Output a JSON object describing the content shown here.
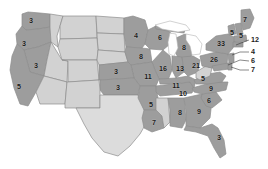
{
  "map": {
    "title": "United States Electoral Vote Map",
    "background_color": "#ffffff",
    "border_color": "#8d8d8d",
    "palette": {
      "dark_gray": "#9d9d9d",
      "light_gray": "#d2d2d2",
      "pale_gray": "#dcdcdc",
      "label_color": "#1c1c1c",
      "lake_color": "#ffffff"
    },
    "legend_note": "",
    "states": [
      {
        "code": "WA",
        "name": "Washington",
        "electoral_votes": "3",
        "shade": "dark",
        "label_x": 31,
        "label_y": 21,
        "labeled": true
      },
      {
        "code": "OR",
        "name": "Oregon",
        "electoral_votes": "3",
        "shade": "dark",
        "label_x": 24,
        "label_y": 44,
        "labeled": true
      },
      {
        "code": "ID",
        "name": "Idaho",
        "electoral_votes": "",
        "shade": "light",
        "label_x": 48,
        "label_y": 42,
        "labeled": false
      },
      {
        "code": "MT",
        "name": "Montana",
        "electoral_votes": "",
        "shade": "light",
        "label_x": 78,
        "label_y": 28,
        "labeled": false
      },
      {
        "code": "ND",
        "name": "North Dakota",
        "electoral_votes": "",
        "shade": "light",
        "label_x": 110,
        "label_y": 28,
        "labeled": false
      },
      {
        "code": "SD",
        "name": "South Dakota",
        "electoral_votes": "",
        "shade": "light",
        "label_x": 110,
        "label_y": 45,
        "labeled": false
      },
      {
        "code": "MN",
        "name": "Minnesota",
        "electoral_votes": "4",
        "shade": "dark",
        "label_x": 136,
        "label_y": 36,
        "labeled": true
      },
      {
        "code": "WI",
        "name": "Wisconsin",
        "electoral_votes": "6",
        "shade": "dark",
        "label_x": 160,
        "label_y": 38,
        "labeled": true
      },
      {
        "code": "MI",
        "name": "Michigan",
        "electoral_votes": "8",
        "shade": "dark",
        "label_x": 184,
        "label_y": 48,
        "labeled": true
      },
      {
        "code": "WY",
        "name": "Wyoming",
        "electoral_votes": "",
        "shade": "light",
        "label_x": 76,
        "label_y": 50,
        "labeled": false
      },
      {
        "code": "NV",
        "name": "Nevada",
        "electoral_votes": "3",
        "shade": "dark",
        "label_x": 36,
        "label_y": 66,
        "labeled": true
      },
      {
        "code": "CA",
        "name": "California",
        "electoral_votes": "5",
        "shade": "dark",
        "label_x": 19,
        "label_y": 87,
        "labeled": true
      },
      {
        "code": "UT",
        "name": "Utah",
        "electoral_votes": "",
        "shade": "light",
        "label_x": 57,
        "label_y": 70,
        "labeled": false
      },
      {
        "code": "CO",
        "name": "Colorado",
        "electoral_votes": "",
        "shade": "light",
        "label_x": 84,
        "label_y": 68,
        "labeled": false
      },
      {
        "code": "NE",
        "name": "Nebraska",
        "electoral_votes": "",
        "shade": "light",
        "label_x": 112,
        "label_y": 58,
        "labeled": false
      },
      {
        "code": "IA",
        "name": "Iowa",
        "electoral_votes": "8",
        "shade": "dark",
        "label_x": 141,
        "label_y": 57,
        "labeled": true
      },
      {
        "code": "IL",
        "name": "Illinois",
        "electoral_votes": "16",
        "shade": "dark",
        "label_x": 163,
        "label_y": 69,
        "labeled": true
      },
      {
        "code": "IN",
        "name": "Indiana",
        "electoral_votes": "13",
        "shade": "dark",
        "label_x": 180,
        "label_y": 69,
        "labeled": true
      },
      {
        "code": "OH",
        "name": "Ohio",
        "electoral_votes": "21",
        "shade": "dark",
        "label_x": 196,
        "label_y": 66,
        "labeled": true
      },
      {
        "code": "MO",
        "name": "Missouri",
        "electoral_votes": "11",
        "shade": "dark",
        "label_x": 148,
        "label_y": 77,
        "labeled": true
      },
      {
        "code": "KS",
        "name": "Kansas",
        "electoral_votes": "3",
        "shade": "dark",
        "label_x": 116,
        "label_y": 72,
        "labeled": true
      },
      {
        "code": "OK",
        "name": "Oklahoma",
        "electoral_votes": "3",
        "shade": "dark",
        "label_x": 118,
        "label_y": 88,
        "labeled": true
      },
      {
        "code": "AZ",
        "name": "Arizona",
        "electoral_votes": "",
        "shade": "light",
        "label_x": 52,
        "label_y": 95,
        "labeled": false
      },
      {
        "code": "NM",
        "name": "New Mexico",
        "electoral_votes": "",
        "shade": "light",
        "label_x": 80,
        "label_y": 97,
        "labeled": false
      },
      {
        "code": "TX",
        "name": "Texas",
        "electoral_votes": "",
        "shade": "pale",
        "label_x": 112,
        "label_y": 126,
        "labeled": false
      },
      {
        "code": "AR",
        "name": "Arkansas",
        "electoral_votes": "5",
        "shade": "dark",
        "label_x": 151,
        "label_y": 105,
        "labeled": true
      },
      {
        "code": "LA",
        "name": "Louisiana",
        "electoral_votes": "7",
        "shade": "dark",
        "label_x": 154,
        "label_y": 123,
        "labeled": true
      },
      {
        "code": "MS",
        "name": "Mississippi",
        "electoral_votes": "",
        "shade": "light",
        "label_x": 167,
        "label_y": 115,
        "labeled": false
      },
      {
        "code": "AL",
        "name": "Alabama",
        "electoral_votes": "8",
        "shade": "dark",
        "label_x": 180,
        "label_y": 113,
        "labeled": true
      },
      {
        "code": "TN",
        "name": "Tennessee",
        "electoral_votes": "11",
        "shade": "dark",
        "label_x": 176,
        "label_y": 86,
        "labeled": true
      },
      {
        "code": "KY",
        "name": "Kentucky",
        "electoral_votes": "10",
        "shade": "dark",
        "label_x": 183,
        "label_y": 94,
        "labeled": true
      },
      {
        "code": "GA",
        "name": "Georgia",
        "electoral_votes": "9",
        "shade": "dark",
        "label_x": 199,
        "label_y": 112,
        "labeled": true
      },
      {
        "code": "FL",
        "name": "Florida",
        "electoral_votes": "3",
        "shade": "dark",
        "label_x": 219,
        "label_y": 138,
        "labeled": true
      },
      {
        "code": "SC",
        "name": "South Carolina",
        "electoral_votes": "6",
        "shade": "dark",
        "label_x": 209,
        "label_y": 101,
        "labeled": true
      },
      {
        "code": "NC",
        "name": "North Carolina",
        "electoral_votes": "9",
        "shade": "dark",
        "label_x": 211,
        "label_y": 89,
        "labeled": true
      },
      {
        "code": "VA",
        "name": "Virginia",
        "electoral_votes": "5",
        "shade": "dark",
        "label_x": 203,
        "label_y": 79,
        "labeled": true
      },
      {
        "code": "PA",
        "name": "Pennsylvania",
        "electoral_votes": "26",
        "shade": "dark",
        "label_x": 214,
        "label_y": 60,
        "labeled": true
      },
      {
        "code": "NY",
        "name": "New York",
        "electoral_votes": "33",
        "shade": "dark",
        "label_x": 221,
        "label_y": 44,
        "labeled": true
      },
      {
        "code": "VT",
        "name": "Vermont",
        "electoral_votes": "5",
        "shade": "dark",
        "label_x": 232,
        "label_y": 33,
        "labeled": true
      },
      {
        "code": "NH",
        "name": "New Hampshire",
        "electoral_votes": "5",
        "shade": "dark",
        "label_x": 241,
        "label_y": 36,
        "labeled": true
      },
      {
        "code": "ME",
        "name": "Maine",
        "electoral_votes": "7",
        "shade": "dark",
        "label_x": 245,
        "label_y": 20,
        "labeled": true
      }
    ],
    "callouts": [
      {
        "code": "MA",
        "name": "Massachusetts",
        "electoral_votes": "12",
        "label_x": 252,
        "label_y": 40,
        "line": [
          [
            249,
            40
          ],
          [
            241,
            43
          ],
          [
            236,
            45
          ]
        ]
      },
      {
        "code": "NJ",
        "name": "New Jersey",
        "electoral_votes": "4",
        "label_x": 252,
        "label_y": 52,
        "line": [
          [
            249,
            52
          ],
          [
            240,
            52
          ],
          [
            232,
            55
          ]
        ]
      },
      {
        "code": "MD",
        "name": "Maryland",
        "electoral_votes": "6",
        "label_x": 252,
        "label_y": 61,
        "line": [
          [
            249,
            61
          ],
          [
            240,
            60
          ],
          [
            228,
            63
          ]
        ]
      },
      {
        "code": "DE",
        "name": "Delaware",
        "electoral_votes": "7",
        "label_x": 252,
        "label_y": 70,
        "line": [
          [
            249,
            70
          ],
          [
            240,
            70
          ],
          [
            229,
            68
          ]
        ]
      }
    ],
    "lakes": [
      {
        "name": "great-lakes"
      }
    ]
  }
}
